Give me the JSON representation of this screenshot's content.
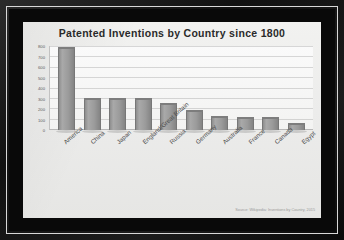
{
  "chart_data": {
    "type": "bar",
    "title": "Patented Inventions by Country since 1800",
    "xlabel": "",
    "ylabel": "",
    "ylim": [
      0,
      800
    ],
    "yticks": [
      800,
      700,
      600,
      500,
      400,
      300,
      200,
      100,
      0
    ],
    "grid": true,
    "legend": "none",
    "categories": [
      "America",
      "China",
      "Japan",
      "England/Great Britain",
      "Russia",
      "Germany",
      "Australia",
      "France",
      "Canada",
      "Egypt"
    ],
    "values": [
      780,
      300,
      300,
      295,
      250,
      185,
      120,
      115,
      115,
      60
    ],
    "bar_color": "#9b9b9b",
    "plot_background": "#f7f7f6",
    "annotations": [
      "Source: Wikipedia: Inventions by Country, 2015"
    ]
  },
  "source": {
    "text": "Source: Wikipedia: Inventions by Country, 2015"
  },
  "frame": {
    "color": "#111111"
  }
}
